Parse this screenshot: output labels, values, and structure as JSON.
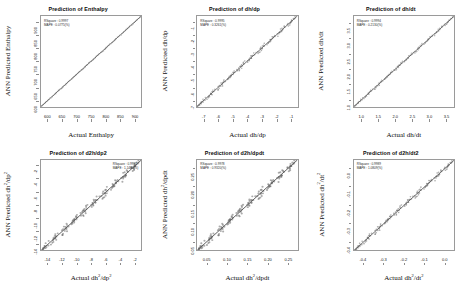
{
  "figure": {
    "background": "#ffffff",
    "panel_count": 6,
    "line_color": "#5a5a5a",
    "frame_color": "#9a9a9a"
  },
  "chart_data": [
    {
      "type": "scatter",
      "title": "Prediction of Enthalpy",
      "xlabel": "Actual Enthalpy",
      "ylabel": "ANN Predicted Enthalpy",
      "xticks": [
        "600",
        "650",
        "700",
        "750",
        "800",
        "850",
        "900"
      ],
      "yticks": [
        "600",
        "650",
        "700",
        "750",
        "800",
        "850",
        "900"
      ],
      "xlim": [
        600,
        900
      ],
      "ylim": [
        600,
        900
      ],
      "grid": false,
      "annotation_position": "left",
      "annotations": [
        "RSquare :  0.9997",
        "MAPE :  0.0775(%)"
      ],
      "series": [
        {
          "name": "ANN vs Actual",
          "relation": "identity-band",
          "spread": 0.004
        }
      ]
    },
    {
      "type": "scatter",
      "title": "Prediction of dh/dp",
      "xlabel": "Actual dh/dp",
      "ylabel": "ANN Predicted dh/dp",
      "xticks": [
        "-7",
        "-6",
        "-5",
        "-4",
        "-3",
        "-2",
        "-1"
      ],
      "yticks": [
        "-7",
        "-6",
        "-5",
        "-4",
        "-3",
        "-2",
        "-1"
      ],
      "xlim": [
        -7,
        -1
      ],
      "ylim": [
        -7,
        -1
      ],
      "grid": false,
      "annotation_position": "left",
      "annotations": [
        "RSquare :  0.9995",
        "MAPE :  0.3261(%)"
      ],
      "series": [
        {
          "name": "ANN vs Actual",
          "relation": "identity-band",
          "spread": 0.012
        }
      ]
    },
    {
      "type": "scatter",
      "title": "Prediction of dh/dt",
      "xlabel": "Actual dh/dt",
      "ylabel": "ANN Predicted dh/dt",
      "xticks": [
        "1.0",
        "1.5",
        "2.0",
        "2.5",
        "3.0",
        "3.5"
      ],
      "yticks": [
        "1.0",
        "1.5",
        "2.0",
        "2.5",
        "3.0",
        "3.5"
      ],
      "xlim": [
        0.75,
        3.75
      ],
      "ylim": [
        0.75,
        3.75
      ],
      "grid": false,
      "annotation_position": "left",
      "annotations": [
        "RSquare :  0.9994",
        "MAPE :  0.2130(%)"
      ],
      "series": [
        {
          "name": "ANN vs Actual",
          "relation": "identity-band",
          "spread": 0.008
        }
      ]
    },
    {
      "type": "scatter",
      "title": "Prediction of d2h/dp2",
      "xlabel_html": "Actual dh<sup>2</sup>/dp<sup>2</sup>",
      "ylabel_html": "ANN Predicted dh<sup>2</sup>/dp<sup>2</sup>",
      "xticks": [
        "-14",
        "-12",
        "-10",
        "-8",
        "-6",
        "-4",
        "-2"
      ],
      "yticks": [
        "-14",
        "-12",
        "-10",
        "-8",
        "-6",
        "-4",
        "-2"
      ],
      "xlim": [
        -15,
        -1
      ],
      "ylim": [
        -15,
        -1
      ],
      "grid": false,
      "annotation_position": "right",
      "annotations": [
        "RSquare :  0.9981",
        "MAPE :  1.1480(%)"
      ],
      "series": [
        {
          "name": "ANN vs Actual",
          "relation": "identity-band",
          "spread": 0.02
        }
      ]
    },
    {
      "type": "scatter",
      "title": "Prediction of d2h/dpdt",
      "xlabel_html": "Actual dh<sup>2</sup>/dpdt",
      "ylabel_html": "ANN Predicted dh<sup>2</sup>/dpdt",
      "xticks": [
        "0.05",
        "0.10",
        "0.15",
        "0.20",
        "0.25"
      ],
      "yticks": [
        "0.05",
        "0.10",
        "0.15",
        "0.20",
        "0.25"
      ],
      "xlim": [
        0.02,
        0.27
      ],
      "ylim": [
        0.02,
        0.27
      ],
      "grid": false,
      "annotation_position": "left",
      "annotations": [
        "RSquare :  0.9978",
        "MAPE :  0.9320(%)"
      ],
      "series": [
        {
          "name": "ANN vs Actual",
          "relation": "identity-band",
          "spread": 0.022
        }
      ]
    },
    {
      "type": "scatter",
      "title": "Prediction of d2h/dt2",
      "xlabel_html": "Actual dh<sup>2</sup>/dt<sup>2</sup>",
      "ylabel_html": "ANN Predicted dh<sup>2</sup>/dt<sup>2</sup>",
      "xticks": [
        "-0.4",
        "-0.3",
        "-0.2",
        "-0.1",
        "0.0"
      ],
      "yticks": [
        "-0.4",
        "-0.3",
        "-0.2",
        "-0.1",
        "0.0"
      ],
      "xlim": [
        -0.44,
        0.02
      ],
      "ylim": [
        -0.44,
        0.02
      ],
      "grid": false,
      "annotation_position": "left",
      "annotations": [
        "RSquare :  0.9989",
        "MAPE :  1.0809(%)"
      ],
      "series": [
        {
          "name": "ANN vs Actual",
          "relation": "identity-band",
          "spread": 0.014
        }
      ]
    }
  ]
}
